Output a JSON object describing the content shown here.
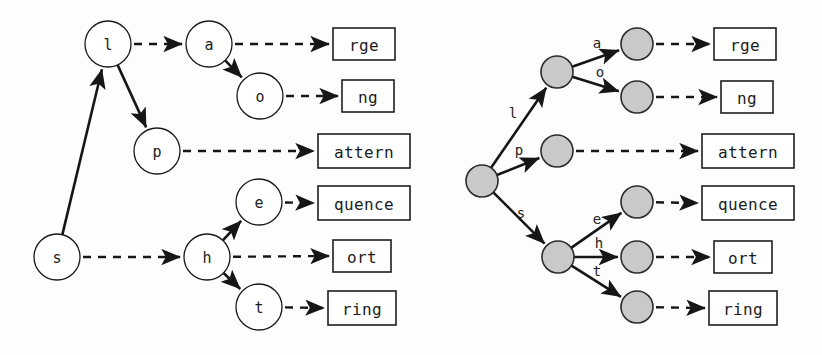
{
  "figure": {
    "width": 822,
    "height": 355,
    "background": "#fdfdfd",
    "ink_color": "#161616",
    "node_fill_open": "#ffffff",
    "node_fill_shaded": "#c9c9c9"
  },
  "left_diagram": {
    "name": "node-labelled-trie",
    "nodes": [
      {
        "id": "s",
        "label": "s",
        "cx": 57,
        "cy": 257,
        "r": 23
      },
      {
        "id": "l",
        "label": "l",
        "cx": 108,
        "cy": 44,
        "r": 23
      },
      {
        "id": "p",
        "label": "p",
        "cx": 157,
        "cy": 151,
        "r": 23
      },
      {
        "id": "a",
        "label": "a",
        "cx": 209,
        "cy": 44,
        "r": 23
      },
      {
        "id": "o",
        "label": "o",
        "cx": 260,
        "cy": 96,
        "r": 23
      },
      {
        "id": "h",
        "label": "h",
        "cx": 207,
        "cy": 257,
        "r": 23
      },
      {
        "id": "e",
        "label": "e",
        "cx": 259,
        "cy": 202,
        "r": 23
      },
      {
        "id": "t",
        "label": "t",
        "cx": 259,
        "cy": 307,
        "r": 23
      }
    ],
    "solid_edges": [
      {
        "from": "s",
        "to": "l"
      },
      {
        "from": "l",
        "to": "p"
      },
      {
        "from": "a",
        "to": "o"
      },
      {
        "from": "h",
        "to": "e"
      },
      {
        "from": "h",
        "to": "t"
      }
    ],
    "dashed_edges": [
      {
        "from": "l",
        "to": "a"
      },
      {
        "from": "s",
        "to": "h"
      },
      {
        "from": "a",
        "to": "box_rge"
      },
      {
        "from": "o",
        "to": "box_ng"
      },
      {
        "from": "p",
        "to": "box_attern"
      },
      {
        "from": "e",
        "to": "box_quence"
      },
      {
        "from": "h",
        "to": "box_ort"
      },
      {
        "from": "t",
        "to": "box_ring"
      }
    ],
    "boxes": [
      {
        "id": "box_rge",
        "text": "rge",
        "x": 333,
        "y": 28,
        "w": 62,
        "h": 32
      },
      {
        "id": "box_ng",
        "text": "ng",
        "x": 342,
        "y": 80,
        "w": 52,
        "h": 32
      },
      {
        "id": "box_attern",
        "text": "attern",
        "x": 318,
        "y": 134,
        "w": 92,
        "h": 34
      },
      {
        "id": "box_quence",
        "text": "quence",
        "x": 318,
        "y": 186,
        "w": 92,
        "h": 34
      },
      {
        "id": "box_ort",
        "text": "ort",
        "x": 333,
        "y": 240,
        "w": 58,
        "h": 32
      },
      {
        "id": "box_ring",
        "text": "ring",
        "x": 328,
        "y": 291,
        "w": 68,
        "h": 34
      }
    ]
  },
  "right_diagram": {
    "name": "edge-labelled-trie",
    "nodes": [
      {
        "id": "root",
        "cx": 482,
        "cy": 181,
        "r": 16
      },
      {
        "id": "n_l",
        "cx": 557,
        "cy": 72,
        "r": 16
      },
      {
        "id": "n_p",
        "cx": 557,
        "cy": 151,
        "r": 16
      },
      {
        "id": "n_s",
        "cx": 558,
        "cy": 257,
        "r": 16
      },
      {
        "id": "n_a",
        "cx": 637,
        "cy": 44,
        "r": 16
      },
      {
        "id": "n_o",
        "cx": 637,
        "cy": 97,
        "r": 16
      },
      {
        "id": "n_e",
        "cx": 637,
        "cy": 202,
        "r": 16
      },
      {
        "id": "n_h",
        "cx": 637,
        "cy": 257,
        "r": 16
      },
      {
        "id": "n_t",
        "cx": 637,
        "cy": 307,
        "r": 16
      }
    ],
    "solid_edges": [
      {
        "from": "root",
        "to": "n_l",
        "label": "l",
        "lx": 513,
        "ly": 113
      },
      {
        "from": "root",
        "to": "n_p",
        "label": "p",
        "lx": 519,
        "ly": 150
      },
      {
        "from": "root",
        "to": "n_s",
        "label": "s",
        "lx": 521,
        "ly": 213
      },
      {
        "from": "n_l",
        "to": "n_a",
        "label": "a",
        "lx": 597,
        "ly": 43
      },
      {
        "from": "n_l",
        "to": "n_o",
        "label": "o",
        "lx": 600,
        "ly": 72
      },
      {
        "from": "n_s",
        "to": "n_e",
        "label": "e",
        "lx": 597,
        "ly": 219
      },
      {
        "from": "n_s",
        "to": "n_h",
        "label": "h",
        "lx": 599,
        "ly": 243
      },
      {
        "from": "n_s",
        "to": "n_t",
        "label": "t",
        "lx": 597,
        "ly": 271
      }
    ],
    "dashed_edges": [
      {
        "from": "n_a",
        "to": "box_rge"
      },
      {
        "from": "n_o",
        "to": "box_ng"
      },
      {
        "from": "n_p",
        "to": "box_attern"
      },
      {
        "from": "n_e",
        "to": "box_quence"
      },
      {
        "from": "n_h",
        "to": "box_ort"
      },
      {
        "from": "n_t",
        "to": "box_ring"
      }
    ],
    "boxes": [
      {
        "id": "box_rge",
        "text": "rge",
        "x": 714,
        "y": 28,
        "w": 62,
        "h": 32
      },
      {
        "id": "box_ng",
        "text": "ng",
        "x": 721,
        "y": 81,
        "w": 52,
        "h": 32
      },
      {
        "id": "box_attern",
        "text": "attern",
        "x": 702,
        "y": 134,
        "w": 92,
        "h": 34
      },
      {
        "id": "box_quence",
        "text": "quence",
        "x": 702,
        "y": 186,
        "w": 92,
        "h": 34
      },
      {
        "id": "box_ort",
        "text": "ort",
        "x": 714,
        "y": 241,
        "w": 58,
        "h": 32
      },
      {
        "id": "box_ring",
        "text": "ring",
        "x": 709,
        "y": 291,
        "w": 68,
        "h": 34
      }
    ]
  },
  "terminal_strings": [
    "rge",
    "ng",
    "attern",
    "quence",
    "ort",
    "ring"
  ],
  "node_letters_left": [
    "s",
    "l",
    "p",
    "a",
    "o",
    "h",
    "e",
    "t"
  ],
  "edge_letters_right": [
    "l",
    "p",
    "s",
    "a",
    "o",
    "e",
    "h",
    "t"
  ]
}
